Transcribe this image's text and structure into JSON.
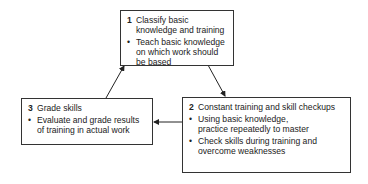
{
  "steps": [
    {
      "num": "1",
      "title": "Classify basic knowledge and training",
      "bullets": [
        "Teach basic knowledge on which work should be based"
      ]
    },
    {
      "num": "2",
      "title": "Constant training and skill checkups",
      "bullets": [
        "Using basic knowledge, practice repeatedly to master",
        "Check skills during training and overcome weaknesses"
      ]
    },
    {
      "num": "3",
      "title": "Grade skills",
      "bullets": [
        "Evaluate and grade results of training in actual work"
      ]
    }
  ],
  "bullet_glyph": "•",
  "colors": {
    "line": "#333333",
    "text": "#222222",
    "background": "#ffffff"
  }
}
